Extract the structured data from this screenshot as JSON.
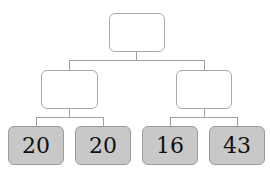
{
  "tree": {
    "root": {
      "label": ""
    },
    "middle": [
      {
        "label": ""
      },
      {
        "label": ""
      }
    ],
    "leaves": [
      {
        "value": "20"
      },
      {
        "value": "20"
      },
      {
        "value": "16"
      },
      {
        "value": "43"
      }
    ]
  },
  "colors": {
    "leaf_fill": "#c8c8c8",
    "border": "#a8a8a8",
    "line": "#a0a0a0"
  }
}
